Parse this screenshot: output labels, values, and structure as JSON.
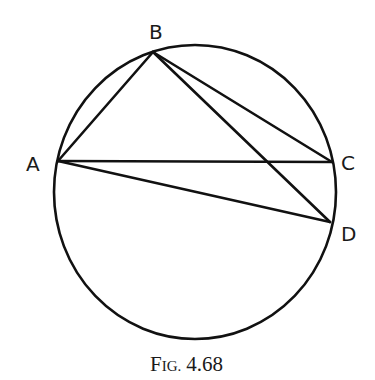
{
  "figure": {
    "caption_prefix": "Fig.",
    "caption_number": "4.68",
    "caption": "Fig. 4.68"
  },
  "points": [
    {
      "id": "A",
      "label": "A"
    },
    {
      "id": "B",
      "label": "B"
    },
    {
      "id": "C",
      "label": "C"
    },
    {
      "id": "D",
      "label": "D"
    }
  ],
  "shapes": {
    "circle": "circumcircle through A, B, C, D",
    "segments": [
      "AB",
      "BC",
      "BD",
      "AC",
      "AD"
    ]
  },
  "colors": {
    "stroke": "#111111",
    "background": "#ffffff"
  }
}
